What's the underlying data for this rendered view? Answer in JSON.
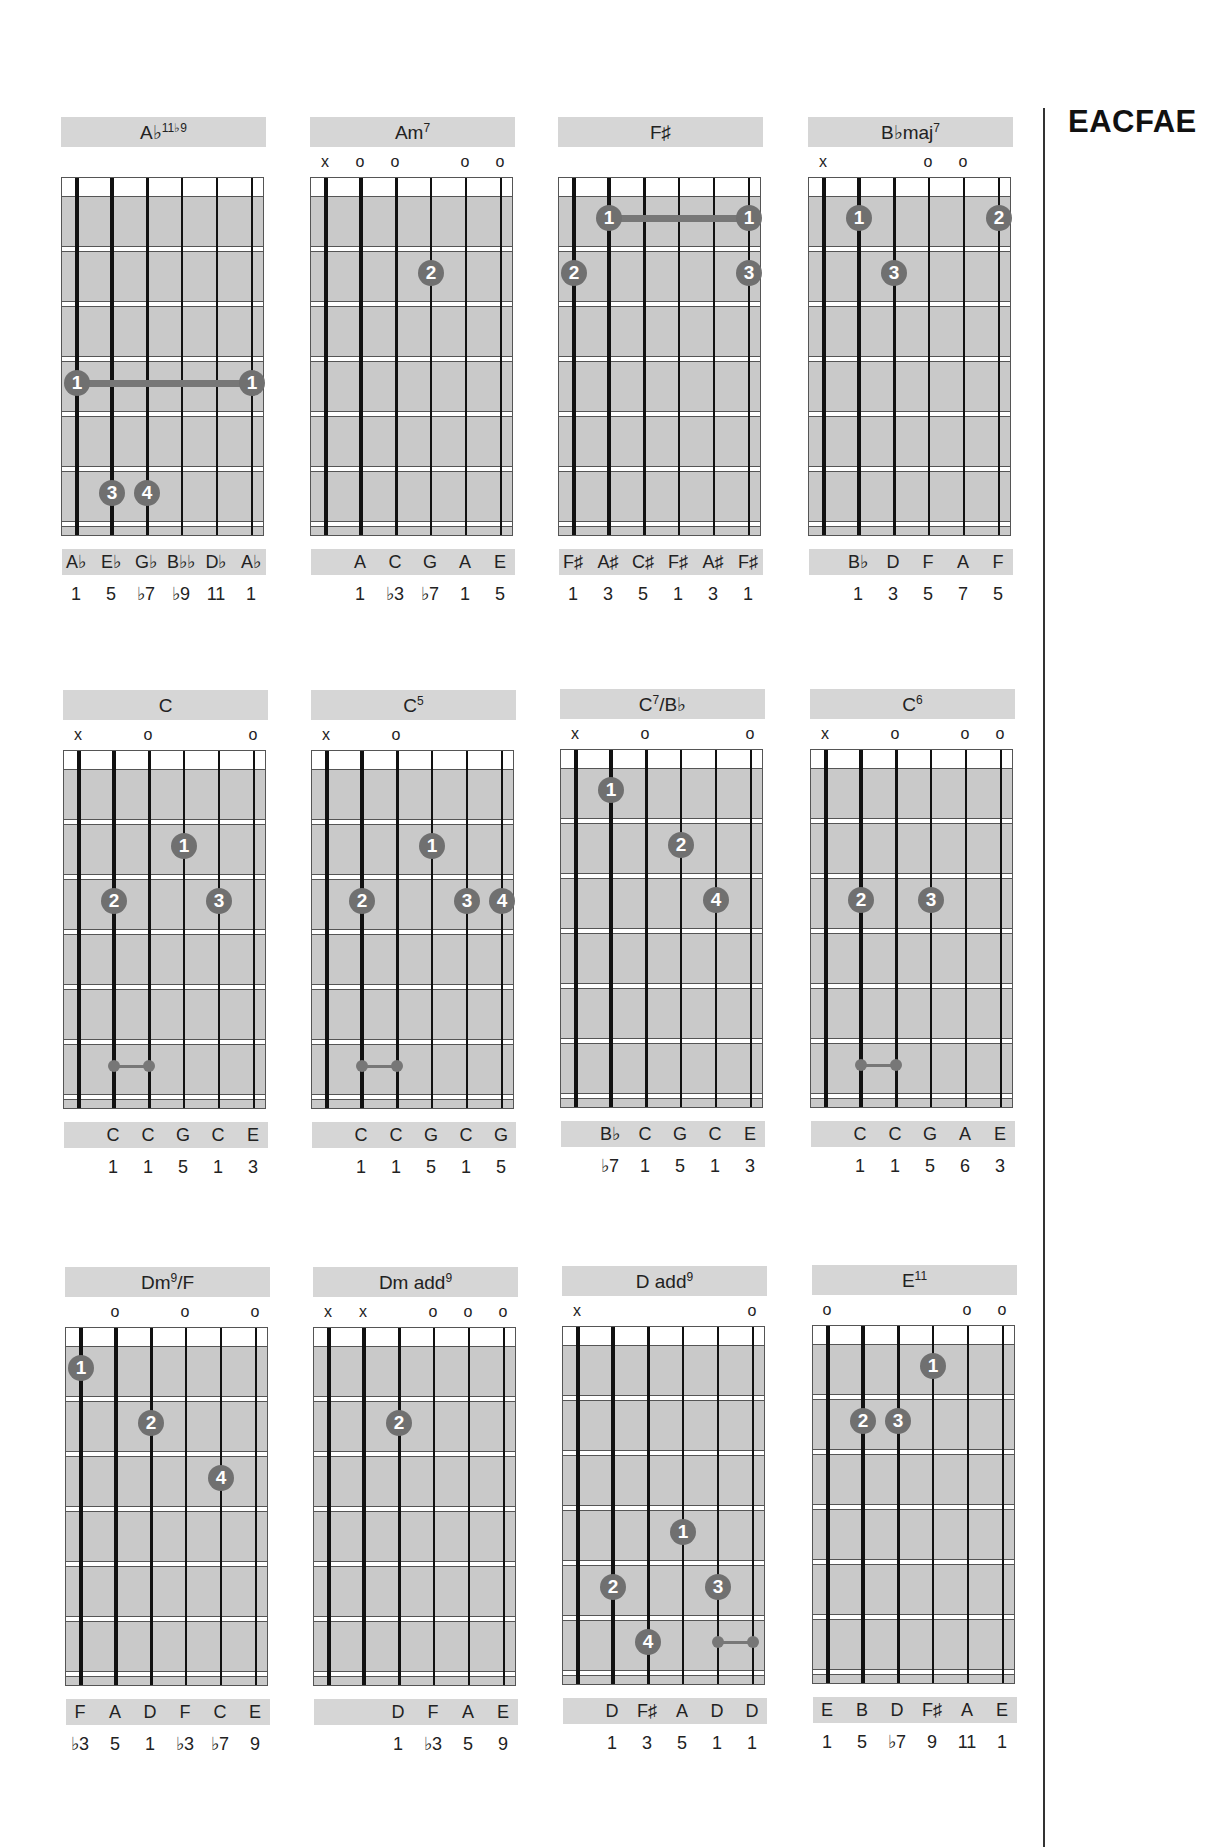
{
  "tuning_label": "EACFAE",
  "chords": [
    {
      "name": "A♭",
      "sup": "11♭9",
      "x": 61,
      "y": 117,
      "markers": [
        "",
        "",
        "",
        "",
        "",
        ""
      ],
      "fingers": [
        {
          "n": "1",
          "f": 4,
          "s": 1
        },
        {
          "n": "1",
          "f": 4,
          "s": 6
        },
        {
          "n": "3",
          "f": 6,
          "s": 2
        },
        {
          "n": "4",
          "f": 6,
          "s": 3
        }
      ],
      "barres": [
        {
          "f": 4,
          "from": 1,
          "to": 6
        }
      ],
      "small": [],
      "notes": [
        "A♭",
        "E♭",
        "G♭",
        "B♭♭",
        "D♭",
        "A♭"
      ],
      "degrees": [
        "1",
        "5",
        "♭7",
        "♭9",
        "11",
        "1"
      ]
    },
    {
      "name": "Am",
      "sup": "7",
      "x": 310,
      "y": 117,
      "markers": [
        "x",
        "o",
        "o",
        "",
        "o",
        "o"
      ],
      "fingers": [
        {
          "n": "2",
          "f": 2,
          "s": 4
        }
      ],
      "barres": [],
      "small": [],
      "notes": [
        "",
        "A",
        "C",
        "G",
        "A",
        "E"
      ],
      "degrees": [
        "",
        "1",
        "♭3",
        "♭7",
        "1",
        "5"
      ]
    },
    {
      "name": "F♯",
      "sup": "",
      "x": 558,
      "y": 117,
      "markers": [
        "",
        "",
        "",
        "",
        "",
        ""
      ],
      "fingers": [
        {
          "n": "1",
          "f": 1,
          "s": 2
        },
        {
          "n": "1",
          "f": 1,
          "s": 6
        },
        {
          "n": "2",
          "f": 2,
          "s": 1
        },
        {
          "n": "3",
          "f": 2,
          "s": 6
        }
      ],
      "barres": [
        {
          "f": 1,
          "from": 2,
          "to": 6
        }
      ],
      "small": [],
      "notes": [
        "F♯",
        "A♯",
        "C♯",
        "F♯",
        "A♯",
        "F♯"
      ],
      "degrees": [
        "1",
        "3",
        "5",
        "1",
        "3",
        "1"
      ]
    },
    {
      "name": "B♭maj",
      "sup": "7",
      "x": 808,
      "y": 117,
      "markers": [
        "x",
        "",
        "",
        "o",
        "o",
        ""
      ],
      "fingers": [
        {
          "n": "1",
          "f": 1,
          "s": 2
        },
        {
          "n": "3",
          "f": 2,
          "s": 3
        },
        {
          "n": "2",
          "f": 1,
          "s": 6
        }
      ],
      "barres": [],
      "small": [],
      "notes": [
        "",
        "B♭",
        "D",
        "F",
        "A",
        "F"
      ],
      "degrees": [
        "",
        "1",
        "3",
        "5",
        "7",
        "5"
      ]
    },
    {
      "name": "C",
      "sup": "",
      "x": 63,
      "y": 690,
      "markers": [
        "x",
        "",
        "o",
        "",
        "",
        "o"
      ],
      "fingers": [
        {
          "n": "1",
          "f": 2,
          "s": 4
        },
        {
          "n": "2",
          "f": 3,
          "s": 2
        },
        {
          "n": "3",
          "f": 3,
          "s": 5
        }
      ],
      "barres": [],
      "small": [
        {
          "f": 6,
          "from": 2,
          "to": 3
        }
      ],
      "notes": [
        "",
        "C",
        "C",
        "G",
        "C",
        "E"
      ],
      "degrees": [
        "",
        "1",
        "1",
        "5",
        "1",
        "3"
      ]
    },
    {
      "name": "C",
      "sup": "5",
      "x": 311,
      "y": 690,
      "markers": [
        "x",
        "",
        "o",
        "",
        "",
        ""
      ],
      "fingers": [
        {
          "n": "1",
          "f": 2,
          "s": 4
        },
        {
          "n": "2",
          "f": 3,
          "s": 2
        },
        {
          "n": "3",
          "f": 3,
          "s": 5
        },
        {
          "n": "4",
          "f": 3,
          "s": 6
        }
      ],
      "barres": [],
      "small": [
        {
          "f": 6,
          "from": 2,
          "to": 3
        }
      ],
      "notes": [
        "",
        "C",
        "C",
        "G",
        "C",
        "G"
      ],
      "degrees": [
        "",
        "1",
        "1",
        "5",
        "1",
        "5"
      ]
    },
    {
      "name": "C",
      "sup": "7",
      "suffix": "/B♭",
      "x": 560,
      "y": 689,
      "markers": [
        "x",
        "",
        "o",
        "",
        "",
        "o"
      ],
      "fingers": [
        {
          "n": "1",
          "f": 1,
          "s": 2
        },
        {
          "n": "2",
          "f": 2,
          "s": 4
        },
        {
          "n": "4",
          "f": 3,
          "s": 5
        }
      ],
      "barres": [],
      "small": [],
      "notes": [
        "",
        "B♭",
        "C",
        "G",
        "C",
        "E"
      ],
      "degrees": [
        "",
        "♭7",
        "1",
        "5",
        "1",
        "3"
      ]
    },
    {
      "name": "C",
      "sup": "6",
      "x": 810,
      "y": 689,
      "markers": [
        "x",
        "",
        "o",
        "",
        "o",
        "o"
      ],
      "fingers": [
        {
          "n": "2",
          "f": 3,
          "s": 2
        },
        {
          "n": "3",
          "f": 3,
          "s": 4
        }
      ],
      "barres": [],
      "small": [
        {
          "f": 6,
          "from": 2,
          "to": 3
        }
      ],
      "notes": [
        "",
        "C",
        "C",
        "G",
        "A",
        "E"
      ],
      "degrees": [
        "",
        "1",
        "1",
        "5",
        "6",
        "3"
      ]
    },
    {
      "name": "Dm",
      "sup": "9",
      "suffix": "/F",
      "x": 65,
      "y": 1267,
      "markers": [
        "",
        "o",
        "",
        "o",
        "",
        "o"
      ],
      "fingers": [
        {
          "n": "1",
          "f": 1,
          "s": 1
        },
        {
          "n": "2",
          "f": 2,
          "s": 3
        },
        {
          "n": "4",
          "f": 3,
          "s": 5
        }
      ],
      "barres": [],
      "small": [],
      "notes": [
        "F",
        "A",
        "D",
        "F",
        "C",
        "E"
      ],
      "degrees": [
        "♭3",
        "5",
        "1",
        "♭3",
        "♭7",
        "9"
      ]
    },
    {
      "name": "Dm add",
      "sup": "9",
      "x": 313,
      "y": 1267,
      "markers": [
        "x",
        "x",
        "",
        "o",
        "o",
        "o"
      ],
      "fingers": [
        {
          "n": "2",
          "f": 2,
          "s": 3
        }
      ],
      "barres": [],
      "small": [],
      "notes": [
        "",
        "",
        "D",
        "F",
        "A",
        "E"
      ],
      "degrees": [
        "",
        "",
        "1",
        "♭3",
        "5",
        "9"
      ]
    },
    {
      "name": "D add",
      "sup": "9",
      "x": 562,
      "y": 1266,
      "markers": [
        "x",
        "",
        "",
        "",
        "",
        "o"
      ],
      "fingers": [
        {
          "n": "1",
          "f": 4,
          "s": 4
        },
        {
          "n": "2",
          "f": 5,
          "s": 2
        },
        {
          "n": "3",
          "f": 5,
          "s": 5
        },
        {
          "n": "4",
          "f": 6,
          "s": 3
        }
      ],
      "barres": [],
      "small": [
        {
          "f": 6,
          "from": 5,
          "to": 6
        }
      ],
      "notes": [
        "",
        "D",
        "F♯",
        "A",
        "D",
        "D"
      ],
      "degrees": [
        "",
        "1",
        "3",
        "5",
        "1",
        "1"
      ]
    },
    {
      "name": "E",
      "sup": "11",
      "x": 812,
      "y": 1265,
      "markers": [
        "o",
        "",
        "",
        "",
        "o",
        "o"
      ],
      "fingers": [
        {
          "n": "1",
          "f": 1,
          "s": 4
        },
        {
          "n": "2",
          "f": 2,
          "s": 2
        },
        {
          "n": "3",
          "f": 2,
          "s": 3
        }
      ],
      "barres": [],
      "small": [],
      "notes": [
        "E",
        "B",
        "D",
        "F♯",
        "A",
        "E"
      ],
      "degrees": [
        "1",
        "5",
        "♭7",
        "9",
        "11",
        "1"
      ]
    }
  ],
  "colors": {
    "board_fill": "#c9c9c9",
    "label_bar": "#d6d6d6",
    "finger_dot": "#707070",
    "string": "#111111"
  }
}
